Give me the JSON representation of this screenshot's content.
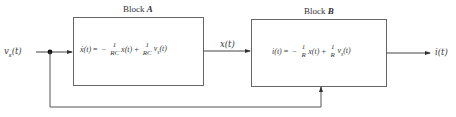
{
  "diagram": {
    "input_label": "v",
    "input_sub": "s",
    "input_arg": "(t)",
    "block_a": {
      "title_prefix": "Block ",
      "title_letter": "A",
      "lhs": "ẋ(t)",
      "eq": "=",
      "minus": "−",
      "frac1_num": "1",
      "frac1_den": "RC",
      "term1": "x(t)",
      "plus": "+",
      "frac2_num": "1",
      "frac2_den": "RC",
      "term2": "v",
      "term2_sub": "s",
      "term2_arg": "(t)"
    },
    "block_b": {
      "title_prefix": "Block ",
      "title_letter": "B",
      "lhs": "i(t)",
      "eq": "=",
      "minus": "−",
      "frac1_num": "1",
      "frac1_den": "R",
      "term1": "x(t)",
      "plus": "+",
      "frac2_num": "1",
      "frac2_den": "R",
      "term2": "v",
      "term2_sub": "s",
      "term2_arg": "(t)"
    },
    "intermediate_label": "x(t)",
    "output_label": "i(t)",
    "colors": {
      "line": "#555555",
      "text": "#333333",
      "background": "#ffffff"
    }
  }
}
